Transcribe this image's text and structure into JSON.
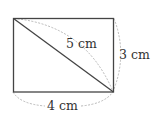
{
  "diagram": {
    "type": "rectangle-with-diagonal",
    "labels": {
      "diagonal": "5 cm",
      "height": "3 cm",
      "width": "4 cm"
    },
    "colors": {
      "stroke": "#333333",
      "dashed": "#aaaaaa",
      "background": "#ffffff"
    }
  }
}
